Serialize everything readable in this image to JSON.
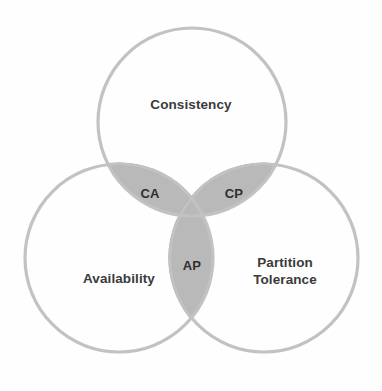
{
  "diagram": {
    "type": "venn-3-set",
    "background_color": "#fefefe",
    "circle_stroke_color": "#c2c2c2",
    "lens_fill_color": "#b9b9b9",
    "lens_stroke_color": "#9c9c9c",
    "label_color": "#3a3a3a",
    "sets": [
      {
        "id": "consistency",
        "label": "Consistency",
        "center_x": 192,
        "center_y": 122,
        "radius": 94
      },
      {
        "id": "availability",
        "label": "Availability",
        "center_x": 119,
        "center_y": 258,
        "radius": 94
      },
      {
        "id": "partition-tolerance",
        "label_line1": "Partition",
        "label_line2": "Tolerance",
        "center_x": 264,
        "center_y": 258,
        "radius": 94
      }
    ],
    "intersections": [
      {
        "id": "ca",
        "label": "CA",
        "between": [
          "consistency",
          "availability"
        ]
      },
      {
        "id": "cp",
        "label": "CP",
        "between": [
          "consistency",
          "partition-tolerance"
        ]
      },
      {
        "id": "ap",
        "label": "AP",
        "between": [
          "availability",
          "partition-tolerance"
        ]
      }
    ]
  }
}
